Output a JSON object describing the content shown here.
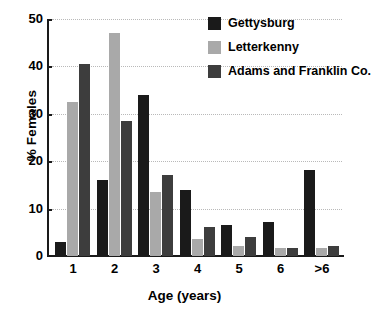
{
  "chart_data": {
    "type": "bar",
    "title": "",
    "xlabel": "Age  (years)",
    "ylabel": "% Females",
    "categories": [
      "1",
      "2",
      "3",
      "4",
      "5",
      "6",
      ">6"
    ],
    "series": [
      {
        "name": "Gettysburg",
        "color": "#1a1a1a",
        "values": [
          3.0,
          16.0,
          34.0,
          14.0,
          6.6,
          7.1,
          18.1
        ]
      },
      {
        "name": "Letterkenny",
        "color": "#a9a9a9",
        "values": [
          32.5,
          47.0,
          13.5,
          3.6,
          2.1,
          1.6,
          1.6
        ]
      },
      {
        "name": "Adams and Franklin Co.",
        "color": "#3d3d3d",
        "values": [
          40.5,
          28.5,
          17.0,
          6.1,
          4.1,
          1.6,
          2.2
        ]
      }
    ],
    "ylim": [
      0,
      50
    ],
    "yticks": [
      "0",
      "10",
      "20",
      "30",
      "40",
      "50"
    ],
    "grid": true,
    "legend_position": "top-right"
  },
  "axes": {
    "y_title": "% Females",
    "x_title": "Age  (years)",
    "y_tick_labels": [
      "50",
      "40",
      "30",
      "20",
      "10",
      "0"
    ],
    "x_tick_labels": [
      "1",
      "2",
      "3",
      "4",
      "5",
      "6",
      ">6"
    ]
  },
  "legend": {
    "items": [
      {
        "label": "Gettysburg",
        "color": "#1a1a1a"
      },
      {
        "label": "Letterkenny",
        "color": "#a9a9a9"
      },
      {
        "label": "Adams and Franklin Co.",
        "color": "#3d3d3d"
      }
    ]
  }
}
